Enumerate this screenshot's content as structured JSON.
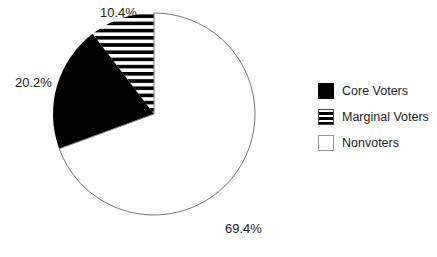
{
  "chart_data": {
    "type": "pie",
    "title": "",
    "categories": [
      "Core Voters",
      "Marginal Voters",
      "Nonvoters"
    ],
    "values": [
      20.2,
      10.4,
      69.4
    ],
    "unit": "%",
    "slice_labels": [
      "20.2%",
      "10.4%",
      "69.4%"
    ],
    "fills": [
      "solid-black",
      "horizontal-stripes",
      "white"
    ],
    "start_angle": "12 o'clock, marginal voters drawn counter-clockwise first",
    "legend_position": "right"
  },
  "legend": {
    "items": [
      {
        "label": "Core Voters",
        "swatch": "solid-black"
      },
      {
        "label": "Marginal Voters",
        "swatch": "horizontal-stripes"
      },
      {
        "label": "Nonvoters",
        "swatch": "white"
      }
    ]
  },
  "labels": {
    "core": "20.2%",
    "marginal": "10.4%",
    "nonvoters": "69.4%"
  },
  "colors": {
    "core": "#000000",
    "stripe": "#000000",
    "nonvoters": "#ffffff",
    "outline": "#777777"
  }
}
